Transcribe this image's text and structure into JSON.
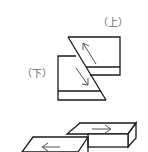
{
  "diagram": {
    "labels": {
      "upper": "（上）",
      "lower": "（下）"
    },
    "colors": {
      "line": "#1a1a1a",
      "arrow": "#555555",
      "label": "#666666",
      "background": "#ffffff"
    }
  }
}
